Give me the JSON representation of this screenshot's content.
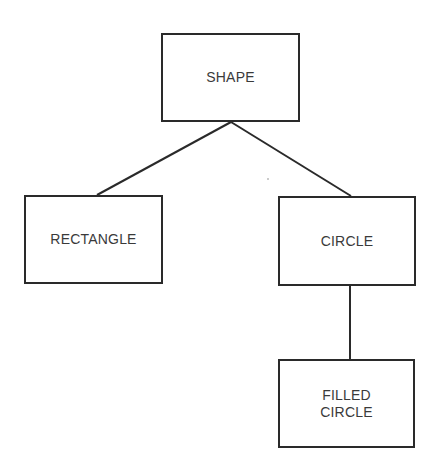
{
  "diagram": {
    "type": "class-hierarchy",
    "line_color": "#2a2a2a",
    "nodes": [
      {
        "id": "shape",
        "label": "SHAPE",
        "x": 161,
        "y": 33,
        "w": 139,
        "h": 89
      },
      {
        "id": "rectangle",
        "label": "RECTANGLE",
        "x": 24,
        "y": 195,
        "w": 139,
        "h": 89
      },
      {
        "id": "circle",
        "label": "CIRCLE",
        "x": 278,
        "y": 196,
        "w": 138,
        "h": 90
      },
      {
        "id": "filled_circle",
        "label": "FILLED\nCIRCLE",
        "x": 278,
        "y": 359,
        "w": 137,
        "h": 89
      }
    ],
    "edges": [
      {
        "from": "shape",
        "to": "rectangle",
        "x1": 231,
        "y1": 122,
        "x2": 97,
        "y2": 195
      },
      {
        "from": "shape",
        "to": "circle",
        "x1": 231,
        "y1": 122,
        "x2": 351,
        "y2": 196
      },
      {
        "from": "circle",
        "to": "filled_circle",
        "x1": 350,
        "y1": 286,
        "x2": 350,
        "y2": 359
      }
    ]
  }
}
